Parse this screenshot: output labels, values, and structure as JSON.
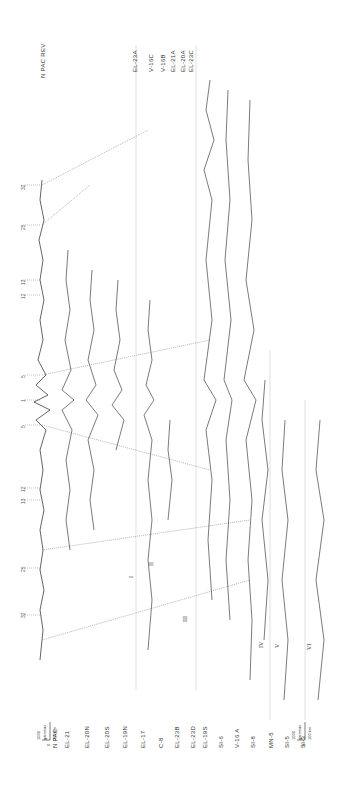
{
  "figure": {
    "reference_profile_label": "N PAC",
    "reversed_reference_label": "N PAC REV"
  },
  "bottom_labels": [
    "N PAC",
    "EL-21",
    "EL-20N",
    "EL-20S",
    "EL-19N",
    "EL-17",
    "C-8",
    "EL-23B",
    "EL-23D",
    "EL-19S",
    "SI-6",
    "V-16 A",
    "SI-8",
    "MN-5",
    "SI-5",
    "SI-3"
  ],
  "top_labels": [
    "N PAC REV",
    "EL-23A",
    "V-16C",
    "V-16B",
    "EL-21A",
    "EL-20A",
    "EL-23C"
  ],
  "axis_ticks_top": [
    "32",
    "25",
    "13",
    "12",
    "5"
  ],
  "axis_ticks_center": "1",
  "axis_ticks_bottom": [
    "5",
    "12",
    "13",
    "25",
    "32"
  ],
  "roman_numerals": [
    "I",
    "II",
    "III",
    "IV",
    "V",
    "VI"
  ],
  "scale_bar_left": {
    "amplitude": "1000",
    "amplitude_unit": "gammas",
    "zero": "0",
    "distance": "200 km"
  },
  "scale_bar_right": {
    "amplitude": "1000",
    "amplitude_unit": "gammas",
    "zero": "0",
    "distance": "100 km"
  }
}
